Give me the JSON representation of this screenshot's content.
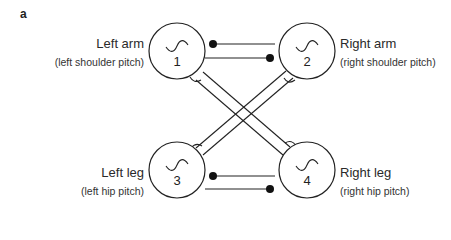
{
  "panel": {
    "label": "a"
  },
  "nodes": [
    {
      "id": "1",
      "number": "1",
      "title": "Left arm",
      "subtitle": "(left shoulder pitch)"
    },
    {
      "id": "2",
      "number": "2",
      "title": "Right arm",
      "subtitle": "(right shoulder pitch)"
    },
    {
      "id": "3",
      "number": "3",
      "title": "Left leg",
      "subtitle": "(left hip pitch)"
    },
    {
      "id": "4",
      "number": "4",
      "title": "Right leg",
      "subtitle": "(right hip pitch)"
    }
  ],
  "connections": [
    {
      "from": "1",
      "to": "2",
      "type": "excitatory",
      "terminal": "dot"
    },
    {
      "from": "2",
      "to": "1",
      "type": "excitatory",
      "terminal": "dot"
    },
    {
      "from": "3",
      "to": "4",
      "type": "excitatory",
      "terminal": "dot"
    },
    {
      "from": "4",
      "to": "3",
      "type": "excitatory",
      "terminal": "dot"
    },
    {
      "from": "1",
      "to": "4",
      "type": "inhibitory",
      "terminal": "cup"
    },
    {
      "from": "4",
      "to": "1",
      "type": "inhibitory",
      "terminal": "cup"
    },
    {
      "from": "2",
      "to": "3",
      "type": "inhibitory",
      "terminal": "cup"
    },
    {
      "from": "3",
      "to": "2",
      "type": "inhibitory",
      "terminal": "cup"
    }
  ],
  "icons": {
    "oscillator": "sine-wave-icon"
  },
  "colors": {
    "stroke": "#222222",
    "background": "#ffffff"
  }
}
